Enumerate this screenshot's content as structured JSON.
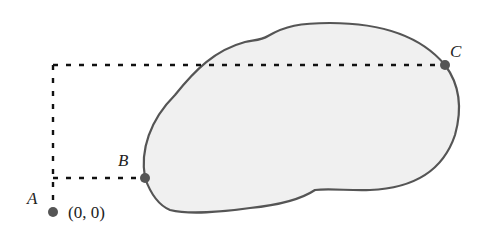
{
  "diagram": {
    "points": [
      {
        "id": "A",
        "label": "A",
        "coord_label": "(0, 0)",
        "x": 53,
        "y": 212
      },
      {
        "id": "B",
        "label": "B",
        "x": 145,
        "y": 178
      },
      {
        "id": "C",
        "label": "C",
        "x": 445,
        "y": 65
      }
    ],
    "colors": {
      "region_fill": "#f0f0f0",
      "region_stroke": "#555555",
      "point": "#555555",
      "dash": "#111111"
    }
  }
}
